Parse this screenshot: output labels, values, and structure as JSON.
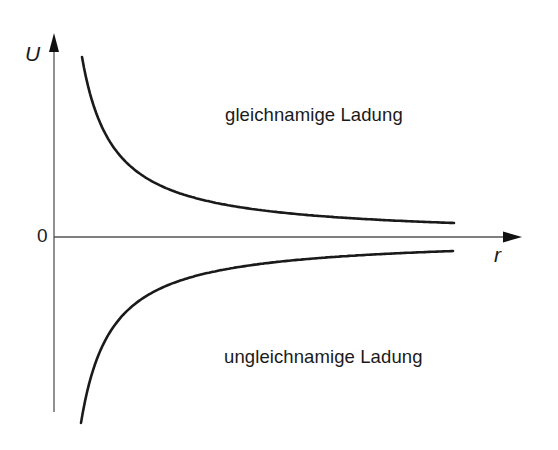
{
  "diagram": {
    "title": "",
    "axes": {
      "y_label": "U",
      "x_label": "r",
      "origin_label": "0"
    },
    "curves": [
      {
        "name": "upper",
        "label": "gleichnamige Ladung",
        "sign": "+"
      },
      {
        "name": "lower",
        "label": "ungleichnamige Ladung",
        "sign": "-"
      }
    ],
    "colors": {
      "line": "#1a1a1a",
      "axis": "#444444",
      "background": "#ffffff"
    }
  },
  "chart_data": {
    "type": "line",
    "title": "",
    "xlabel": "r",
    "ylabel": "U",
    "grid": false,
    "legend": "inline labels",
    "series": [
      {
        "name": "gleichnamige Ladung",
        "function": "U ∝ +1/r",
        "x": [
          0.1,
          0.2,
          0.4,
          0.6,
          0.8,
          1.0
        ],
        "values": [
          10,
          5,
          2.5,
          1.67,
          1.25,
          1.0
        ]
      },
      {
        "name": "ungleichnamige Ladung",
        "function": "U ∝ -1/r",
        "x": [
          0.1,
          0.2,
          0.4,
          0.6,
          0.8,
          1.0
        ],
        "values": [
          -10,
          -5,
          -2.5,
          -1.67,
          -1.25,
          -1.0
        ]
      }
    ],
    "annotations": [
      "0",
      "gleichnamige Ladung",
      "ungleichnamige Ladung"
    ]
  }
}
